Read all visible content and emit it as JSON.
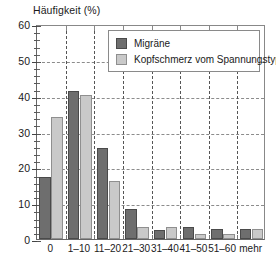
{
  "chart_data": {
    "type": "bar",
    "title": "Häufigkeit (%)",
    "xlabel": "",
    "ylabel": "Häufigkeit (%)",
    "categories": [
      "0",
      "1–10",
      "11–20",
      "21–30",
      "31–40",
      "41–50",
      "51–60",
      "mehr"
    ],
    "series": [
      {
        "name": "Migräne",
        "color": "#6e6e6e",
        "values": [
          17.4,
          41.4,
          25.3,
          8.5,
          2.5,
          3.4,
          2.7,
          2.7
        ]
      },
      {
        "name": "Kopfschmerz vom Spannungstyp",
        "color": "#c9c9c9",
        "values": [
          34.1,
          40.3,
          16.3,
          3.4,
          3.4,
          1.4,
          1.5,
          2.7
        ]
      }
    ],
    "ylim": [
      0,
      60
    ],
    "yticks": [
      0,
      10,
      20,
      30,
      40,
      50,
      60
    ],
    "ytick_labels": [
      "0",
      "10",
      "20",
      "30",
      "40",
      "50",
      "60"
    ],
    "yminor_step": 2,
    "grid": "dashed-both",
    "legend_position": "top-center"
  },
  "axis": {
    "title": "Häufigkeit (%)",
    "y_labels": [
      "60",
      "50",
      "40",
      "30",
      "20",
      "10",
      "0"
    ],
    "x_labels": [
      "0",
      "1–10",
      "11–20",
      "21–30",
      "31–40",
      "41–50",
      "51–60",
      "mehr"
    ]
  },
  "legend": {
    "items": [
      {
        "label": "Migräne",
        "color": "#6e6e6e"
      },
      {
        "label": "Kopfschmerz vom Spannungstyp",
        "color": "#c9c9c9"
      }
    ]
  }
}
